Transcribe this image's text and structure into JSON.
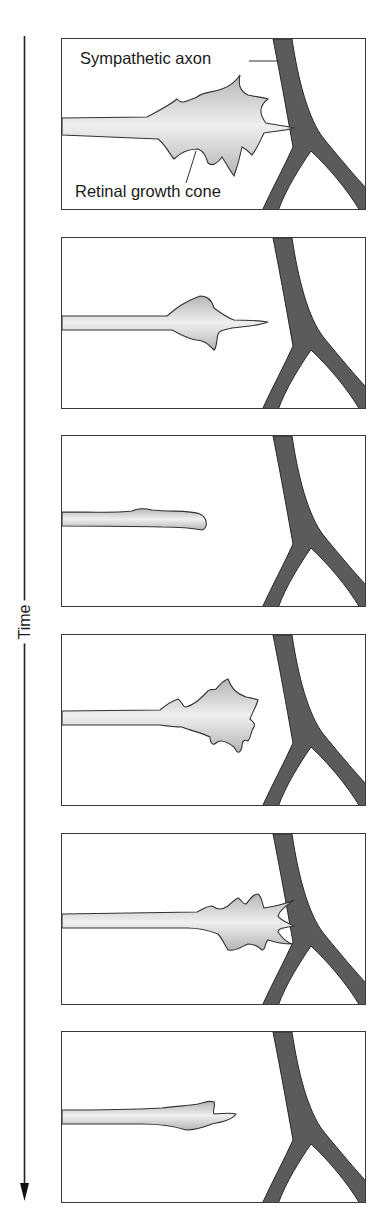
{
  "figure": {
    "time_axis": {
      "label": "Time",
      "direction": "down"
    },
    "labels": {
      "sympathetic_axon": "Sympathetic axon",
      "retinal_growth_cone": "Retinal growth cone"
    },
    "colors": {
      "axon_fill": "#5a5a5a",
      "cone_fill": "#c8c8c8",
      "cone_highlight": "#eeeeee",
      "outline": "#333333",
      "frame": "#3a3a3a"
    },
    "panels": [
      {
        "index": 1,
        "state": "Growth cone with many filopodia contacts sympathetic axon",
        "top": 38
      },
      {
        "index": 2,
        "state": "Growth cone retracts, filopodia reduced",
        "top": 237
      },
      {
        "index": 3,
        "state": "Growth cone collapsed, neurite retracted",
        "top": 435
      },
      {
        "index": 4,
        "state": "Growth cone re-expands and advances",
        "top": 634
      },
      {
        "index": 5,
        "state": "Filopodia contact axon again",
        "top": 833
      },
      {
        "index": 6,
        "state": "Growth cone collapses and retracts again",
        "top": 1031
      }
    ]
  }
}
